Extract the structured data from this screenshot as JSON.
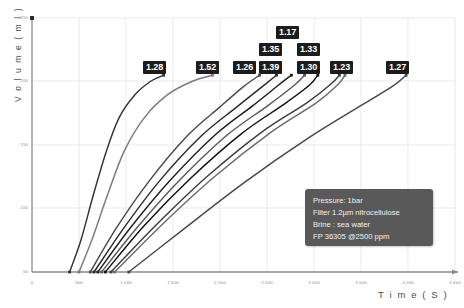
{
  "chart_data": {
    "type": "line",
    "xlabel": "T i m e  ( S )",
    "ylabel": "V o l u m e  ( m l )",
    "xlim": [
      0,
      4500
    ],
    "ylim": [
      50,
      250
    ],
    "grid": true,
    "legend_position": "none",
    "xticks": [
      "0",
      "500",
      "1 000",
      "1 500",
      "2 000",
      "2 500",
      "3 000",
      "3 500",
      "4 000",
      "4 500"
    ],
    "xtick_values": [
      0,
      500,
      1000,
      1500,
      2000,
      2500,
      3000,
      3500,
      4000,
      4500
    ],
    "yticks": [
      "250",
      "200",
      "150",
      "100",
      "50"
    ],
    "ytick_values": [
      250,
      200,
      150,
      100,
      50
    ],
    "series": [
      {
        "name": "1.28",
        "label": "1.28",
        "color": "#333333",
        "points": [
          [
            400,
            50
          ],
          [
            520,
            75
          ],
          [
            650,
            110
          ],
          [
            790,
            145
          ],
          [
            930,
            172
          ],
          [
            1100,
            190
          ],
          [
            1260,
            200
          ],
          [
            1400,
            205
          ]
        ]
      },
      {
        "name": "1.52",
        "label": "1.52",
        "color": "#7a7a7a",
        "points": [
          [
            500,
            50
          ],
          [
            640,
            76
          ],
          [
            800,
            110
          ],
          [
            980,
            145
          ],
          [
            1200,
            172
          ],
          [
            1450,
            190
          ],
          [
            1700,
            200
          ],
          [
            1920,
            205
          ]
        ]
      },
      {
        "name": "1.26",
        "label": "1.26",
        "color": "#4a4a4a",
        "points": [
          [
            620,
            50
          ],
          [
            900,
            85
          ],
          [
            1250,
            122
          ],
          [
            1650,
            157
          ],
          [
            2000,
            180
          ],
          [
            2250,
            196
          ],
          [
            2420,
            205
          ]
        ]
      },
      {
        "name": "1.39",
        "label": "1.39",
        "color": "#2b2b2b",
        "points": [
          [
            660,
            50
          ],
          [
            980,
            85
          ],
          [
            1360,
            122
          ],
          [
            1800,
            157
          ],
          [
            2180,
            180
          ],
          [
            2450,
            196
          ],
          [
            2600,
            205
          ]
        ]
      },
      {
        "name": "1.35",
        "label": "1.35",
        "color": "#1f1f1f",
        "points": [
          [
            700,
            50
          ],
          [
            1060,
            86
          ],
          [
            1480,
            123
          ],
          [
            1950,
            158
          ],
          [
            2350,
            181
          ],
          [
            2620,
            197
          ],
          [
            2760,
            205
          ]
        ]
      },
      {
        "name": "1.17",
        "label": "1.17",
        "color": "#5a5a5a",
        "points": [
          [
            740,
            50
          ],
          [
            1130,
            86
          ],
          [
            1580,
            123
          ],
          [
            2080,
            158
          ],
          [
            2510,
            181
          ],
          [
            2790,
            197
          ],
          [
            2900,
            205
          ]
        ]
      },
      {
        "name": "1.30",
        "label": "1.30",
        "color": "#111111",
        "points": [
          [
            780,
            50
          ],
          [
            1200,
            87
          ],
          [
            1690,
            124
          ],
          [
            2230,
            159
          ],
          [
            2680,
            182
          ],
          [
            2950,
            197
          ],
          [
            3040,
            205
          ]
        ]
      },
      {
        "name": "1.33",
        "label": "1.33",
        "color": "#3d3d3d",
        "points": [
          [
            840,
            50
          ],
          [
            1320,
            87
          ],
          [
            1860,
            125
          ],
          [
            2440,
            160
          ],
          [
            2920,
            183
          ],
          [
            3180,
            198
          ],
          [
            3270,
            205
          ]
        ]
      },
      {
        "name": "1.23",
        "label": "1.23",
        "color": "#6b6b6b",
        "points": [
          [
            880,
            50
          ],
          [
            1380,
            87
          ],
          [
            1940,
            125
          ],
          [
            2540,
            160
          ],
          [
            3020,
            183
          ],
          [
            3260,
            198
          ],
          [
            3330,
            205
          ]
        ]
      },
      {
        "name": "1.27",
        "label": "1.27",
        "color": "#474747",
        "points": [
          [
            1030,
            50
          ],
          [
            1600,
            83
          ],
          [
            2250,
            120
          ],
          [
            2950,
            156
          ],
          [
            3520,
            182
          ],
          [
            3850,
            197
          ],
          [
            3980,
            205
          ]
        ]
      }
    ],
    "annotations": [
      {
        "label": "1.28",
        "x": 1400,
        "y": 205
      },
      {
        "label": "1.52",
        "x": 1920,
        "y": 205
      },
      {
        "label": "1.26",
        "x": 2420,
        "y": 205
      },
      {
        "label": "1.35",
        "x": 2760,
        "y": 205
      },
      {
        "label": "1.39",
        "x": 2600,
        "y": 205
      },
      {
        "label": "1.17",
        "x": 2900,
        "y": 205
      },
      {
        "label": "1.33",
        "x": 3270,
        "y": 205
      },
      {
        "label": "1.30",
        "x": 3040,
        "y": 205
      },
      {
        "label": "1.23",
        "x": 3330,
        "y": 205
      },
      {
        "label": "1.27",
        "x": 3980,
        "y": 205
      }
    ]
  },
  "axes": {
    "y_title": "V o l u m e  ( m l )",
    "x_title": "T i m e  ( S )",
    "y_ticks": [
      "250",
      "200",
      "150",
      "100",
      "50"
    ],
    "x_ticks": [
      "0",
      "500",
      "1 000",
      "1 500",
      "2 000",
      "2 500",
      "3 000",
      "3 500",
      "4 000",
      "4 500"
    ]
  },
  "callouts": {
    "c0": "1.28",
    "c1": "1.52",
    "c2": "1.26",
    "c3": "1.35",
    "c4": "1.39",
    "c5": "1.17",
    "c6": "1.33",
    "c7": "1.30",
    "c8": "1.23",
    "c9": "1.27"
  },
  "info_panel": {
    "line0": "Pressure: 1bar",
    "line1": "Filter 1.2µm nitrocellulose",
    "line2": "Brine : sea water",
    "line3": "FP 36305  @2500 ppm",
    "background": "#595959",
    "text_color": "#f2f2f2"
  },
  "title": {
    "text": " "
  },
  "colors": {
    "grid": "#d9e2ef",
    "axis": "#808080",
    "tick_text": "#8c8c8c",
    "callout_bg": "#1c1c1c",
    "callout_text": "#ffffff"
  }
}
